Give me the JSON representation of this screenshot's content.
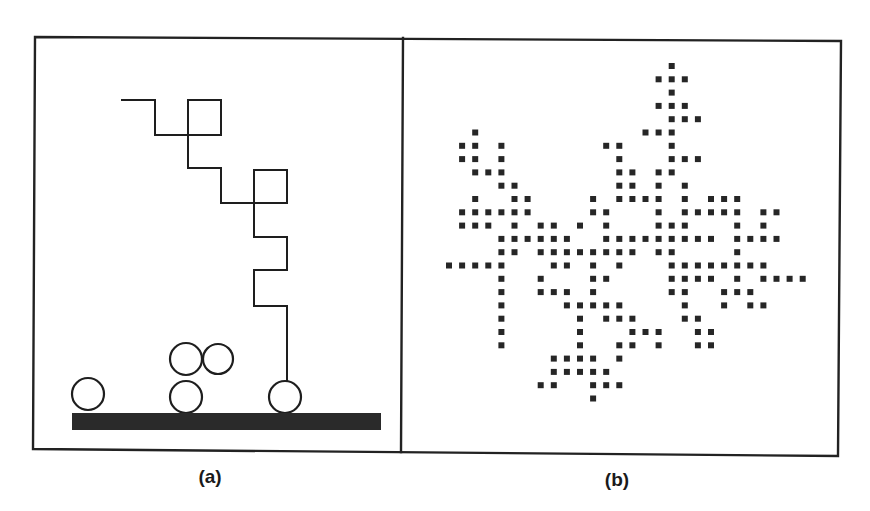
{
  "figure": {
    "background": "#ffffff",
    "ink_color": "#222222"
  },
  "panels": [
    {
      "id": "a",
      "label": "(a)",
      "label_pos": {
        "x": 210,
        "y": 467
      },
      "description": "Random walk of a particle toward a substrate with deposited particles",
      "walk_path": [
        [
          122,
          100
        ],
        [
          155,
          100
        ],
        [
          155,
          135
        ],
        [
          221,
          135
        ],
        [
          221,
          100
        ],
        [
          188,
          100
        ],
        [
          188,
          168
        ],
        [
          221,
          168
        ],
        [
          221,
          203
        ],
        [
          287,
          203
        ],
        [
          287,
          170
        ],
        [
          254,
          170
        ],
        [
          254,
          237
        ],
        [
          287,
          237
        ],
        [
          287,
          270
        ],
        [
          254,
          270
        ],
        [
          254,
          306
        ],
        [
          287,
          306
        ],
        [
          287,
          380
        ]
      ],
      "particles": [
        {
          "cx": 88,
          "cy": 394,
          "r": 16
        },
        {
          "cx": 186,
          "cy": 397,
          "r": 16
        },
        {
          "cx": 186,
          "cy": 359,
          "r": 16
        },
        {
          "cx": 218,
          "cy": 359,
          "r": 15
        },
        {
          "cx": 285,
          "cy": 397,
          "r": 16
        }
      ],
      "substrate": {
        "x": 72,
        "y": 413,
        "width": 309,
        "height": 17
      }
    },
    {
      "id": "b",
      "label": "(b)",
      "label_pos": {
        "x": 617,
        "y": 470
      },
      "description": "Diffusion-limited aggregation cluster on a square lattice",
      "grid": {
        "x0": 449,
        "y0": 66,
        "pitch_x": 13.1,
        "pitch_y": 13.3,
        "dot_size": 6
      },
      "cluster_rows": [
        {
          "row": 0,
          "cols": [
            17
          ]
        },
        {
          "row": 1,
          "cols": [
            16,
            17,
            18
          ]
        },
        {
          "row": 2,
          "cols": [
            17
          ]
        },
        {
          "row": 3,
          "cols": [
            16,
            17,
            18
          ]
        },
        {
          "row": 4,
          "cols": [
            17,
            18,
            19
          ]
        },
        {
          "row": 5,
          "cols": [
            2,
            15,
            16,
            17
          ]
        },
        {
          "row": 6,
          "cols": [
            1,
            2,
            4,
            12,
            13,
            17
          ]
        },
        {
          "row": 7,
          "cols": [
            1,
            2,
            4,
            13,
            17,
            18,
            19
          ]
        },
        {
          "row": 8,
          "cols": [
            2,
            3,
            4,
            13,
            14,
            16,
            17
          ]
        },
        {
          "row": 9,
          "cols": [
            4,
            5,
            13,
            14,
            16,
            18
          ]
        },
        {
          "row": 10,
          "cols": [
            2,
            5,
            6,
            11,
            13,
            14,
            15,
            16,
            18,
            20,
            21,
            22
          ]
        },
        {
          "row": 11,
          "cols": [
            1,
            2,
            3,
            4,
            5,
            6,
            11,
            12,
            16,
            18,
            19,
            20,
            21,
            22,
            24,
            25
          ]
        },
        {
          "row": 12,
          "cols": [
            1,
            2,
            3,
            5,
            7,
            8,
            10,
            12,
            16,
            17,
            18,
            22,
            24
          ]
        },
        {
          "row": 13,
          "cols": [
            4,
            5,
            6,
            7,
            8,
            9,
            12,
            13,
            14,
            15,
            16,
            17,
            18,
            19,
            20,
            22,
            23,
            24,
            25
          ]
        },
        {
          "row": 14,
          "cols": [
            4,
            5,
            7,
            8,
            9,
            10,
            11,
            12,
            13,
            14,
            16,
            17,
            22
          ]
        },
        {
          "row": 15,
          "cols": [
            0,
            1,
            2,
            3,
            4,
            8,
            9,
            11,
            13,
            17,
            18,
            19,
            20,
            21,
            22,
            23,
            24
          ]
        },
        {
          "row": 16,
          "cols": [
            4,
            7,
            11,
            12,
            17,
            18,
            19,
            20,
            22,
            24,
            25,
            26,
            27
          ]
        },
        {
          "row": 17,
          "cols": [
            4,
            7,
            8,
            9,
            11,
            17,
            18,
            21,
            22,
            23
          ]
        },
        {
          "row": 18,
          "cols": [
            4,
            9,
            10,
            11,
            12,
            13,
            18,
            21,
            23,
            24
          ]
        },
        {
          "row": 19,
          "cols": [
            4,
            10,
            12,
            13,
            14,
            18,
            19
          ]
        },
        {
          "row": 20,
          "cols": [
            4,
            10,
            14,
            15,
            16,
            19,
            20
          ]
        },
        {
          "row": 21,
          "cols": [
            4,
            10,
            13,
            14,
            16,
            19,
            20
          ]
        },
        {
          "row": 22,
          "cols": [
            8,
            9,
            10,
            11,
            13
          ]
        },
        {
          "row": 23,
          "cols": [
            8,
            9,
            10,
            11,
            12
          ]
        },
        {
          "row": 24,
          "cols": [
            7,
            8,
            11,
            12,
            13
          ]
        },
        {
          "row": 25,
          "cols": [
            11
          ]
        }
      ]
    }
  ],
  "frame": {
    "outer": [
      [
        35,
        37
      ],
      [
        841,
        41
      ],
      [
        838,
        456
      ],
      [
        33,
        449
      ]
    ],
    "divider": [
      [
        403,
        38
      ],
      [
        401,
        452
      ]
    ]
  }
}
